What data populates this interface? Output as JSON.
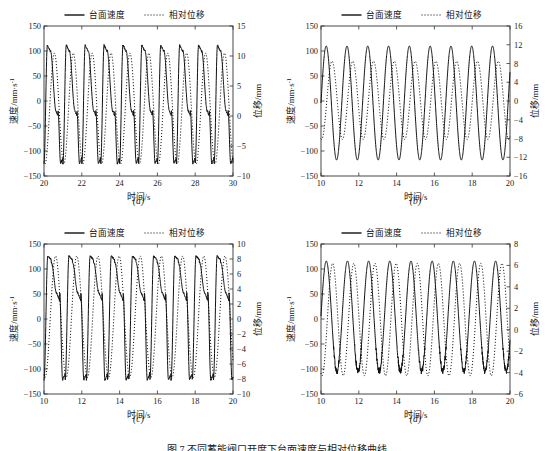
{
  "figure": {
    "caption": "图 7   不同蓄能阀口开度下台面速度与相对位移曲线",
    "legend": {
      "velocity_label": "台面速度",
      "displacement_label": "相对位移",
      "velocity_style": "solid",
      "displacement_style": "dotted"
    },
    "axis_titles": {
      "x": "时间/s",
      "y_left": "速度/mm·s",
      "y_left_exp": "-1",
      "y_right": "位移/mm"
    },
    "line_color": "#111111"
  },
  "chart_data": [
    {
      "type": "line",
      "panel": "(a)",
      "title": "",
      "xlabel": "时间/s",
      "ylabel": "速度/mm·s-1",
      "y2label": "位移/mm",
      "xlim": [
        20,
        30
      ],
      "ylim": [
        -150,
        150
      ],
      "y2lim": [
        -10,
        15
      ],
      "xticks": [
        20,
        22,
        24,
        26,
        28,
        30
      ],
      "yticks": [
        -150,
        -100,
        -50,
        0,
        50,
        100,
        150
      ],
      "y2ticks": [
        -10,
        -5,
        0,
        5,
        10,
        15
      ],
      "grid": false,
      "legend_position": "top-center-outside",
      "series": [
        {
          "name": "台面速度",
          "style": "solid",
          "axis": "left",
          "cycles": 10,
          "period": 1.0,
          "phase": 0.0,
          "peak": 112,
          "trough": -125,
          "shoulder_level": -20,
          "shoulder_frac": 0.3,
          "waveform": "asymmetric-shoulder"
        },
        {
          "name": "相对位移",
          "style": "dotted",
          "axis": "right",
          "cycles": 10,
          "period": 1.0,
          "phase": 0.3,
          "peak": 10.5,
          "trough": -8.0,
          "waveform": "sine"
        }
      ]
    },
    {
      "type": "line",
      "panel": "(b)",
      "title": "",
      "xlabel": "时间/s",
      "ylabel": "速度/mm·s-1",
      "y2label": "位移/mm",
      "xlim": [
        10,
        20
      ],
      "ylim": [
        -150,
        150
      ],
      "y2lim": [
        -16,
        16
      ],
      "xticks": [
        10,
        12,
        14,
        16,
        18,
        20
      ],
      "yticks": [
        -150,
        -100,
        -50,
        0,
        50,
        100,
        150
      ],
      "y2ticks": [
        -16,
        -12,
        -8,
        -4,
        0,
        4,
        8,
        12,
        16
      ],
      "grid": false,
      "legend_position": "top-center-outside",
      "series": [
        {
          "name": "台面速度",
          "style": "solid",
          "axis": "left",
          "cycles": 9,
          "period": 1.1,
          "phase": 0.0,
          "peak": 110,
          "trough": -118,
          "waveform": "sine"
        },
        {
          "name": "相对位移",
          "style": "dotted",
          "axis": "right",
          "cycles": 9,
          "period": 1.1,
          "phase": 0.28,
          "peak": 8.5,
          "trough": -8.2,
          "waveform": "sine"
        }
      ]
    },
    {
      "type": "line",
      "panel": "(c)",
      "title": "",
      "xlabel": "时间/s",
      "ylabel": "速度/mm·s-1",
      "y2label": "位移/mm",
      "xlim": [
        10,
        20
      ],
      "ylim": [
        -150,
        150
      ],
      "y2lim": [
        -10,
        10
      ],
      "xticks": [
        10,
        12,
        14,
        16,
        18,
        20
      ],
      "yticks": [
        -150,
        -100,
        -50,
        0,
        50,
        100,
        150
      ],
      "y2ticks": [
        -10,
        -8,
        -6,
        -4,
        -2,
        0,
        2,
        4,
        6,
        8,
        10
      ],
      "grid": false,
      "legend_position": "top-center-outside",
      "series": [
        {
          "name": "台面速度",
          "style": "solid",
          "axis": "left",
          "cycles": 9,
          "period": 1.12,
          "phase": 0.0,
          "peak": 126,
          "trough": -122,
          "shoulder_level": 52,
          "shoulder_frac": 0.26,
          "waveform": "asymmetric-shoulder"
        },
        {
          "name": "相对位移",
          "style": "dotted",
          "axis": "right",
          "cycles": 9,
          "period": 1.12,
          "phase": 0.3,
          "peak": 8.4,
          "trough": -7.8,
          "waveform": "sine"
        }
      ]
    },
    {
      "type": "line",
      "panel": "(d)",
      "title": "",
      "xlabel": "时间/s",
      "ylabel": "速度/mm·s-1",
      "y2label": "位移/mm",
      "xlim": [
        10,
        20
      ],
      "ylim": [
        -150,
        150
      ],
      "y2lim": [
        -6,
        8
      ],
      "xticks": [
        10,
        12,
        14,
        16,
        18,
        20
      ],
      "yticks": [
        -150,
        -100,
        -50,
        0,
        50,
        100,
        150
      ],
      "y2ticks": [
        -6,
        -4,
        -2,
        0,
        2,
        4,
        6,
        8
      ],
      "grid": false,
      "legend_position": "top-center-outside",
      "series": [
        {
          "name": "台面速度",
          "style": "solid",
          "axis": "left",
          "cycles": 9,
          "period": 1.12,
          "phase": 0.0,
          "peak": 116,
          "trough": -105,
          "noise_trough": 12,
          "waveform": "sine-noisy-trough"
        },
        {
          "name": "相对位移",
          "style": "dotted",
          "axis": "right",
          "cycles": 9,
          "period": 1.12,
          "phase": 0.3,
          "peak": 6.2,
          "trough": -4.3,
          "waveform": "sine"
        }
      ]
    }
  ],
  "panels": [
    {
      "key": "a",
      "label": "(a)"
    },
    {
      "key": "b",
      "label": "(b)"
    },
    {
      "key": "c",
      "label": "(c)"
    },
    {
      "key": "d",
      "label": "(d)"
    }
  ]
}
